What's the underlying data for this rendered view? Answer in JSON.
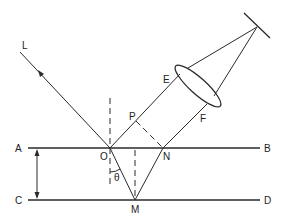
{
  "diagram": {
    "type": "optics-reflection-geometry",
    "labels": {
      "L": "L",
      "A": "A",
      "B": "B",
      "C": "C",
      "D": "D",
      "O": "O",
      "M": "M",
      "N": "N",
      "P": "P",
      "E": "E",
      "F": "F",
      "theta": "θ"
    },
    "components": [
      "incident-ray",
      "upper-surface-AB",
      "lower-surface-CD",
      "thickness-arrow",
      "normal-at-O",
      "normal-at-M",
      "refracted-ray-OM",
      "reflected-ray-MN",
      "perpendicular-PN",
      "lens",
      "mirror",
      "ray-O-to-lens",
      "ray-N-to-lens",
      "rays-to-mirror"
    ]
  }
}
